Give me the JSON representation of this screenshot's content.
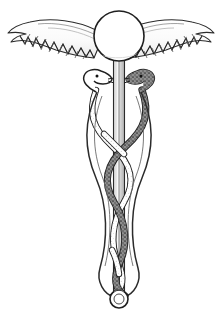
{
  "image": {
    "title": "Caduceus",
    "subject": "caduceus-symbol",
    "style": "black-and-white line engraving",
    "width": 222,
    "height": 331,
    "background_color": "#ffffff"
  },
  "palette": {
    "background": "#ffffff",
    "ink": "#1a1a1a",
    "outline": "#2b2b2b",
    "snake_dark_fill": "#8c8c8c",
    "snake_dark_stipple": "#3a3a3a",
    "snake_light_fill": "#fdfdfd",
    "staff_fill": "#e9e9e9",
    "staff_shade": "#bdbdbd",
    "sphere_fill": "#ffffff",
    "wing_fill": "#ffffff",
    "wing_shade": "#cfcfcf"
  },
  "parts": {
    "sphere": {
      "label": "Orb",
      "center_x": 119,
      "center_y": 36,
      "radius": 25
    },
    "staff": {
      "label": "Staff",
      "top_y": 58,
      "bottom_y": 295,
      "x_center": 119,
      "width": 11
    },
    "finial": {
      "label": "Bottom ring",
      "center_x": 119,
      "center_y": 299,
      "outer_radius": 9,
      "inner_radius": 5
    },
    "wing_left": {
      "label": "Left wing",
      "tip_x": 8,
      "root_x": 96,
      "top_y": 20,
      "bottom_y": 62,
      "feather_count": 13
    },
    "wing_right": {
      "label": "Right wing",
      "tip_x": 213,
      "root_x": 142,
      "top_y": 20,
      "bottom_y": 62,
      "feather_count": 13
    },
    "snake_dark": {
      "label": "Right serpent (shaded)",
      "head_x": 147,
      "head_y": 76,
      "fill": "#8c8c8c",
      "coil_crossings": 3
    },
    "snake_light": {
      "label": "Left serpent (outline)",
      "head_x": 91,
      "head_y": 76,
      "fill": "#fdfdfd",
      "coil_crossings": 3
    }
  },
  "helix": {
    "label": "Entwined serpent coils",
    "top_y": 86,
    "bottom_y": 296,
    "amplitude": 30,
    "turns": 3
  }
}
